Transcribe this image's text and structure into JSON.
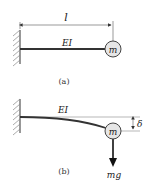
{
  "figure_a": {
    "caption": "(a)",
    "length_label": "l",
    "beam_label": "EI",
    "mass_label": "m"
  },
  "figure_b": {
    "caption": "(b)",
    "beam_label": "EI",
    "mass_label": "m",
    "deflection_label": "δ",
    "force_label": "mg"
  },
  "colors": {
    "line": "#333333",
    "mass_fill": "#e6e6e6"
  }
}
